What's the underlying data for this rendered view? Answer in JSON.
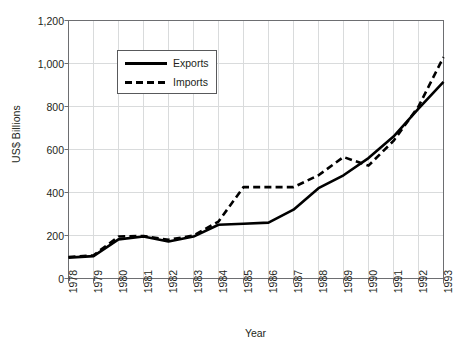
{
  "chart_data": {
    "type": "line",
    "title": "",
    "xlabel": "Year",
    "ylabel": "US$ Billions",
    "ylim": [
      0,
      1200
    ],
    "yticks": [
      "0",
      "200",
      "400",
      "600",
      "800",
      "1,000",
      "1,200"
    ],
    "ytick_values": [
      0,
      200,
      400,
      600,
      800,
      1000,
      1200
    ],
    "grid": true,
    "legend_position": "upper-left-inside",
    "categories": [
      "1978",
      "1979",
      "1980",
      "1981",
      "1982",
      "1983",
      "1984",
      "1985",
      "1986",
      "1987",
      "1988",
      "1989",
      "1990",
      "1991",
      "1992",
      "1993"
    ],
    "x": [
      1978,
      1979,
      1980,
      1981,
      1982,
      1983,
      1984,
      1985,
      1986,
      1987,
      1988,
      1989,
      1990,
      1991,
      1992,
      1993
    ],
    "series": [
      {
        "name": "Exports",
        "style": "solid",
        "color": "#000000",
        "values": [
          97,
          104,
          182,
          195,
          172,
          195,
          250,
          255,
          260,
          320,
          420,
          480,
          560,
          660,
          790,
          915
        ]
      },
      {
        "name": "Imports",
        "style": "dashed",
        "color": "#000000",
        "values": [
          100,
          108,
          195,
          198,
          180,
          200,
          265,
          425,
          425,
          425,
          480,
          565,
          525,
          640,
          800,
          1030
        ]
      }
    ]
  },
  "legend": {
    "entries": [
      {
        "label": "Exports",
        "style": "solid"
      },
      {
        "label": "Imports",
        "style": "dashed"
      }
    ]
  },
  "axes": {
    "x_title": "Year",
    "y_title": "US$ Billions"
  },
  "colors": {
    "line": "#000000",
    "axis": "#6d6e71",
    "grid": "#d9dbdc",
    "text": "#231f20",
    "background": "#ffffff"
  }
}
